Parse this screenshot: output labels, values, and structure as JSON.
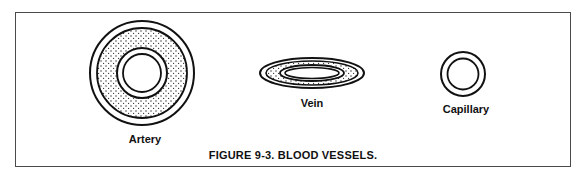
{
  "figure": {
    "caption": "FIGURE 9-3.  BLOOD VESSELS.",
    "border_color": "#4a4a4a",
    "stroke_color": "#111111"
  },
  "vessels": [
    {
      "id": "artery",
      "label": "Artery"
    },
    {
      "id": "vein",
      "label": "Vein"
    },
    {
      "id": "capillary",
      "label": "Capillary"
    }
  ]
}
